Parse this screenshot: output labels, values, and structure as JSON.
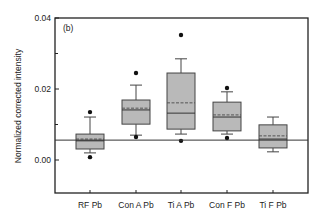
{
  "chart_data": {
    "type": "box",
    "panel_label": "(b)",
    "title": "",
    "xlabel": "",
    "ylabel": "Normalized corrected intensity",
    "ylim": [
      -0.0093,
      0.04
    ],
    "yticks": [
      0.0,
      0.02,
      0.04
    ],
    "ytick_labels": [
      "0.00",
      "0.02",
      "0.04"
    ],
    "minor_yticks": [
      0.01,
      0.03
    ],
    "grid": false,
    "legend": null,
    "reference_line": 0.0056,
    "categories": [
      "RF Pb",
      "Con A Pb",
      "Ti A Pb",
      "Con F Pb",
      "Ti F Pb"
    ],
    "boxes": [
      {
        "name": "RF Pb",
        "whisker_low": 0.002,
        "q1": 0.0031,
        "median": 0.0054,
        "mean": 0.0059,
        "q3": 0.0073,
        "whisker_high": 0.0121,
        "outliers": [
          0.0008,
          0.0135
        ]
      },
      {
        "name": "Con A Pb",
        "whisker_low": 0.007,
        "q1": 0.0101,
        "median": 0.0141,
        "mean": 0.0146,
        "q3": 0.0169,
        "whisker_high": 0.0211,
        "outliers": [
          0.0065,
          0.0245
        ]
      },
      {
        "name": "Ti A Pb",
        "whisker_low": 0.0073,
        "q1": 0.0087,
        "median": 0.0132,
        "mean": 0.0161,
        "q3": 0.0245,
        "whisker_high": 0.0285,
        "outliers": [
          0.0054,
          0.0352
        ]
      },
      {
        "name": "Con F Pb",
        "whisker_low": 0.0073,
        "q1": 0.0082,
        "median": 0.0121,
        "mean": 0.0127,
        "q3": 0.0163,
        "whisker_high": 0.0192,
        "outliers": [
          0.0062,
          0.0203
        ]
      },
      {
        "name": "Ti F Pb",
        "whisker_low": 0.0023,
        "q1": 0.0034,
        "median": 0.0059,
        "mean": 0.0068,
        "q3": 0.0099,
        "whisker_high": 0.0121,
        "outliers": []
      }
    ],
    "colors": {
      "box_fill": "#b9b9b9",
      "box_stroke": "#444444",
      "axis": "#222222",
      "mean_line": "#555555"
    }
  }
}
